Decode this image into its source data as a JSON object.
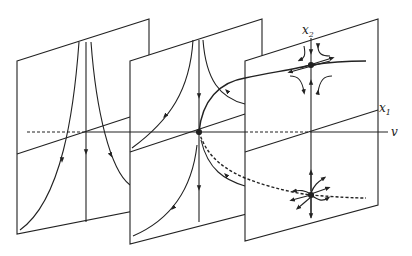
{
  "figure": {
    "type": "bifurcation-diagram",
    "labels": {
      "x1": "x",
      "x1_sub": "1",
      "x2": "x",
      "x2_sub": "2",
      "v": "v"
    },
    "panels": [
      {
        "id": "left",
        "content": "no equilibria; flow lines downward"
      },
      {
        "id": "middle",
        "content": "saddle-node equilibrium at bifurcation point"
      },
      {
        "id": "right",
        "content": "saddle (upper) and node (lower) equilibria"
      }
    ],
    "colors": {
      "ink": "#222222",
      "background": "#ffffff"
    }
  }
}
